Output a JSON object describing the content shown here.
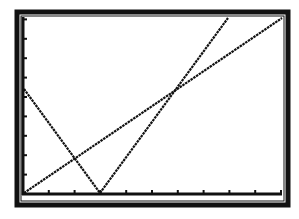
{
  "chart_data": {
    "type": "line",
    "title": "",
    "xlabel": "",
    "ylabel": "",
    "grid": false,
    "legend": null,
    "axes": {
      "x_ticks_count": 10,
      "y_ticks_count": 9
    },
    "series": [
      {
        "name": "line-descending",
        "points_px": [
          [
            24,
            89
          ],
          [
            100,
            193
          ]
        ]
      },
      {
        "name": "line-steep-ascending",
        "points_px": [
          [
            100,
            193
          ],
          [
            228,
            18
          ]
        ]
      },
      {
        "name": "line-shallow-ascending",
        "points_px": [
          [
            24,
            193
          ],
          [
            282,
            18
          ]
        ]
      }
    ],
    "intersections_px": [
      [
        73,
        159
      ],
      [
        176,
        88
      ],
      [
        100,
        193
      ]
    ]
  },
  "colors": {
    "background": "#ffffff",
    "ink": "#111111"
  }
}
